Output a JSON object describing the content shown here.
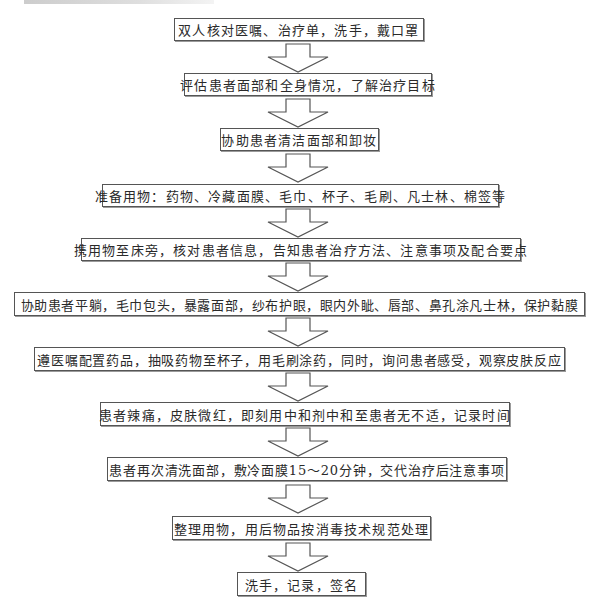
{
  "flowchart": {
    "steps": [
      {
        "label": "双人核对医嘱、治疗单，洗手，戴口罩"
      },
      {
        "label": "评估患者面部和全身情况，了解治疗目标"
      },
      {
        "label": "协助患者清洁面部和卸妆"
      },
      {
        "label": "准备用物：药物、冷藏面膜、毛巾、杯子、毛刷、凡士林、棉签等"
      },
      {
        "label": "携用物至床旁，核对患者信息，告知患者治疗方法、注意事项及配合要点"
      },
      {
        "label": "协助患者平躺，毛巾包头，暴露面部，纱布护眼，眼内外眦、唇部、鼻孔涂凡士林，保护黏膜"
      },
      {
        "label": "遵医嘱配置药品，抽吸药物至杯子，用毛刷涂药，同时，询问患者感受，观察皮肤反应"
      },
      {
        "label": "患者辣痛，皮肤微红，即刻用中和剂中和至患者无不适，记录时间"
      },
      {
        "label": "患者再次清洗面部，敷冷面膜15～20分钟，交代治疗后注意事项"
      },
      {
        "label": "整理用物，用后物品按消毒技术规范处理"
      },
      {
        "label": "洗手，记录，签名"
      }
    ],
    "connector_icon": "hollow-down-arrow",
    "colors": {
      "border": "#555555",
      "background": "#ffffff",
      "text": "#2a2a2a"
    }
  }
}
